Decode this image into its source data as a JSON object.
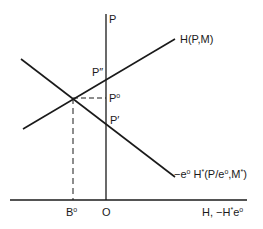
{
  "diagram": {
    "type": "economics-supply-demand-diagram",
    "axes": {
      "vertical_label": "P",
      "horizontal_label_main": "H, −H",
      "horizontal_label_sup1": "*",
      "horizontal_label_tail": "e",
      "horizontal_label_sup2": "o",
      "origin_label": "O"
    },
    "curves": {
      "upward": {
        "label_main": "H(P,M)"
      },
      "downward": {
        "label_part1": "−e",
        "label_sup1": "o",
        "label_part2": " H",
        "label_sup2": "*",
        "label_part3": "(P/e",
        "label_sup3": "o",
        "label_part4": ",M",
        "label_sup4": "*",
        "label_part5": ")"
      }
    },
    "points": {
      "p_double_prime": "P″",
      "p_zero_main": "P",
      "p_zero_sup": "o",
      "p_prime": "P′",
      "b_zero_main": "B",
      "b_zero_sup": "o"
    },
    "colors": {
      "line": "#1a1a1a",
      "background": "#ffffff"
    }
  }
}
